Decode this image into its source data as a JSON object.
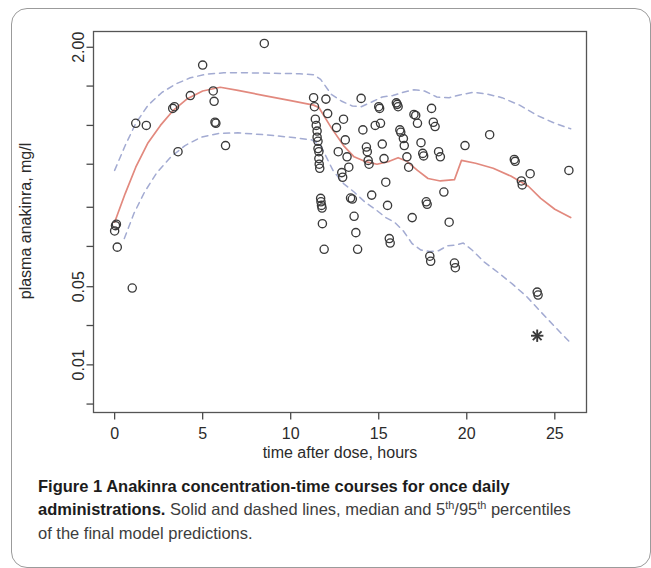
{
  "figure": {
    "caption_label": "Figure 1",
    "caption_title": " Anakinra concentration-time courses for once daily administrations.",
    "caption_rest_1": " Solid and dashed lines, median and 5",
    "caption_sup_1": "th",
    "caption_slash": "/95",
    "caption_sup_2": "th",
    "caption_rest_2": " percentiles of the final model predictions."
  },
  "colors": {
    "median_line": "#e2897e",
    "percentile_line": "#a3abd2",
    "point_stroke": "#3a3a3a",
    "axis": "#4a4a4a",
    "frame": "#555555"
  },
  "chart_data": {
    "type": "scatter",
    "title": "",
    "xlabel": "time after dose, hours",
    "ylabel": "plasma anakinra, mg/l",
    "yscale": "log",
    "xlim": [
      -1.2,
      26.8
    ],
    "ylim": [
      0.0072,
      2.55
    ],
    "grid": false,
    "legend": "none",
    "xticks": [
      0,
      5,
      10,
      15,
      20,
      25
    ],
    "xticklabels": [
      "0",
      "5",
      "10",
      "15",
      "20",
      "25"
    ],
    "yticks": [
      2.0,
      1.1,
      0.6,
      0.33,
      0.17,
      0.093,
      0.05,
      0.0275,
      0.015,
      0.0082
    ],
    "yticklabels": [
      "2.00",
      "",
      "",
      "",
      "",
      "",
      "0.05",
      "",
      "0.01",
      ""
    ],
    "ytick_labelled": [
      {
        "value": 2.0,
        "label": "2.00"
      },
      {
        "value": 0.05,
        "label": "0.05"
      },
      {
        "value": 0.01,
        "label": "0.01"
      }
    ],
    "series": [
      {
        "name": "observed concentrations",
        "marker": "open-circle",
        "points": [
          [
            0.0,
            0.118
          ],
          [
            0.05,
            0.128
          ],
          [
            0.1,
            0.131
          ],
          [
            0.15,
            0.092
          ],
          [
            1.0,
            0.049
          ],
          [
            1.2,
            0.62
          ],
          [
            1.8,
            0.6
          ],
          [
            3.3,
            0.78
          ],
          [
            3.4,
            0.8
          ],
          [
            3.6,
            0.4
          ],
          [
            4.3,
            0.95
          ],
          [
            5.0,
            1.52
          ],
          [
            5.6,
            1.02
          ],
          [
            5.65,
            0.87
          ],
          [
            5.7,
            0.63
          ],
          [
            5.75,
            0.62
          ],
          [
            6.3,
            0.44
          ],
          [
            8.5,
            2.12
          ],
          [
            11.3,
            0.92
          ],
          [
            11.35,
            0.8
          ],
          [
            11.4,
            0.66
          ],
          [
            11.45,
            0.6
          ],
          [
            11.5,
            0.55
          ],
          [
            11.5,
            0.5
          ],
          [
            11.55,
            0.47
          ],
          [
            11.55,
            0.42
          ],
          [
            11.6,
            0.4
          ],
          [
            11.6,
            0.36
          ],
          [
            11.62,
            0.33
          ],
          [
            11.65,
            0.31
          ],
          [
            11.7,
            0.195
          ],
          [
            11.72,
            0.185
          ],
          [
            11.75,
            0.175
          ],
          [
            11.78,
            0.168
          ],
          [
            11.8,
            0.132
          ],
          [
            11.9,
            0.089
          ],
          [
            12.0,
            0.9
          ],
          [
            12.1,
            0.72
          ],
          [
            12.6,
            0.58
          ],
          [
            12.7,
            0.4
          ],
          [
            12.9,
            0.29
          ],
          [
            12.95,
            0.27
          ],
          [
            13.0,
            0.66
          ],
          [
            13.1,
            0.48
          ],
          [
            13.2,
            0.37
          ],
          [
            13.3,
            0.315
          ],
          [
            13.4,
            0.196
          ],
          [
            13.5,
            0.193
          ],
          [
            13.6,
            0.148
          ],
          [
            13.7,
            0.115
          ],
          [
            13.8,
            0.089
          ],
          [
            14.0,
            0.91
          ],
          [
            14.1,
            0.56
          ],
          [
            14.3,
            0.43
          ],
          [
            14.35,
            0.4
          ],
          [
            14.4,
            0.35
          ],
          [
            14.45,
            0.33
          ],
          [
            14.6,
            0.205
          ],
          [
            14.8,
            0.6
          ],
          [
            15.0,
            0.8
          ],
          [
            15.05,
            0.78
          ],
          [
            15.1,
            0.62
          ],
          [
            15.2,
            0.45
          ],
          [
            15.3,
            0.36
          ],
          [
            15.4,
            0.25
          ],
          [
            15.5,
            0.175
          ],
          [
            15.6,
            0.105
          ],
          [
            15.65,
            0.098
          ],
          [
            16.0,
            0.85
          ],
          [
            16.05,
            0.83
          ],
          [
            16.1,
            0.8
          ],
          [
            16.2,
            0.56
          ],
          [
            16.25,
            0.54
          ],
          [
            16.4,
            0.49
          ],
          [
            16.45,
            0.44
          ],
          [
            16.6,
            0.37
          ],
          [
            16.7,
            0.315
          ],
          [
            16.9,
            0.145
          ],
          [
            17.0,
            0.71
          ],
          [
            17.1,
            0.7
          ],
          [
            17.2,
            0.62
          ],
          [
            17.4,
            0.46
          ],
          [
            17.5,
            0.39
          ],
          [
            17.55,
            0.375
          ],
          [
            17.7,
            0.185
          ],
          [
            17.75,
            0.178
          ],
          [
            17.9,
            0.08
          ],
          [
            17.95,
            0.074
          ],
          [
            18.0,
            0.78
          ],
          [
            18.1,
            0.63
          ],
          [
            18.2,
            0.59
          ],
          [
            18.4,
            0.4
          ],
          [
            18.5,
            0.37
          ],
          [
            18.7,
            0.215
          ],
          [
            19.0,
            0.135
          ],
          [
            19.3,
            0.072
          ],
          [
            19.35,
            0.067
          ],
          [
            19.9,
            0.44
          ],
          [
            21.3,
            0.52
          ],
          [
            22.7,
            0.355
          ],
          [
            22.75,
            0.345
          ],
          [
            23.1,
            0.255
          ],
          [
            23.15,
            0.24
          ],
          [
            23.6,
            0.285
          ],
          [
            24.0,
            0.046
          ],
          [
            24.05,
            0.044
          ],
          [
            25.8,
            0.3
          ]
        ]
      },
      {
        "name": "below quantification limit",
        "marker": "asterisk",
        "points": [
          [
            24.0,
            0.0235
          ]
        ]
      }
    ],
    "lines": [
      {
        "name": "median (50th percentile) model prediction",
        "style": "solid",
        "color": "#e2897e",
        "points": [
          [
            0.0,
            0.135
          ],
          [
            0.6,
            0.21
          ],
          [
            1.2,
            0.315
          ],
          [
            1.9,
            0.46
          ],
          [
            2.6,
            0.6
          ],
          [
            3.3,
            0.75
          ],
          [
            4.1,
            0.9
          ],
          [
            5.0,
            1.02
          ],
          [
            6.0,
            1.08
          ],
          [
            7.0,
            1.03
          ],
          [
            8.5,
            0.95
          ],
          [
            10.0,
            0.88
          ],
          [
            11.3,
            0.82
          ],
          [
            11.6,
            0.79
          ],
          [
            12.3,
            0.58
          ],
          [
            13.0,
            0.44
          ],
          [
            13.6,
            0.37
          ],
          [
            14.2,
            0.345
          ],
          [
            14.9,
            0.33
          ],
          [
            15.6,
            0.345
          ],
          [
            16.1,
            0.365
          ],
          [
            16.6,
            0.345
          ],
          [
            17.2,
            0.3
          ],
          [
            17.8,
            0.265
          ],
          [
            18.5,
            0.255
          ],
          [
            19.3,
            0.26
          ],
          [
            19.7,
            0.35
          ],
          [
            20.5,
            0.335
          ],
          [
            21.5,
            0.31
          ],
          [
            22.5,
            0.275
          ],
          [
            23.5,
            0.235
          ],
          [
            24.2,
            0.195
          ],
          [
            25.0,
            0.165
          ],
          [
            25.9,
            0.145
          ]
        ]
      },
      {
        "name": "95th percentile model prediction",
        "style": "dashed",
        "color": "#a3abd2",
        "points": [
          [
            0.0,
            0.3
          ],
          [
            0.6,
            0.44
          ],
          [
            1.2,
            0.62
          ],
          [
            1.9,
            0.82
          ],
          [
            2.7,
            1.0
          ],
          [
            3.5,
            1.14
          ],
          [
            4.3,
            1.25
          ],
          [
            5.2,
            1.32
          ],
          [
            6.2,
            1.35
          ],
          [
            7.5,
            1.35
          ],
          [
            9.0,
            1.34
          ],
          [
            10.5,
            1.33
          ],
          [
            11.3,
            1.31
          ],
          [
            11.7,
            1.22
          ],
          [
            12.3,
            0.97
          ],
          [
            12.9,
            0.87
          ],
          [
            13.5,
            0.81
          ],
          [
            14.0,
            0.8
          ],
          [
            14.6,
            0.86
          ],
          [
            15.2,
            0.93
          ],
          [
            15.8,
            0.95
          ],
          [
            16.4,
            1.0
          ],
          [
            17.0,
            1.04
          ],
          [
            17.6,
            1.02
          ],
          [
            18.3,
            0.93
          ],
          [
            19.0,
            0.92
          ],
          [
            19.6,
            0.96
          ],
          [
            20.4,
            1.0
          ],
          [
            21.2,
            0.97
          ],
          [
            22.0,
            0.92
          ],
          [
            23.0,
            0.82
          ],
          [
            24.0,
            0.7
          ],
          [
            25.0,
            0.62
          ],
          [
            25.9,
            0.57
          ]
        ]
      },
      {
        "name": "5th percentile model prediction",
        "style": "dashed",
        "color": "#a3abd2",
        "points": [
          [
            0.55,
            0.105
          ],
          [
            1.1,
            0.155
          ],
          [
            1.7,
            0.215
          ],
          [
            2.4,
            0.29
          ],
          [
            3.2,
            0.37
          ],
          [
            4.0,
            0.44
          ],
          [
            4.9,
            0.5
          ],
          [
            5.9,
            0.53
          ],
          [
            7.0,
            0.535
          ],
          [
            8.5,
            0.52
          ],
          [
            10.0,
            0.5
          ],
          [
            11.2,
            0.48
          ],
          [
            11.7,
            0.44
          ],
          [
            12.4,
            0.3
          ],
          [
            13.0,
            0.245
          ],
          [
            13.6,
            0.215
          ],
          [
            14.2,
            0.185
          ],
          [
            14.8,
            0.165
          ],
          [
            15.4,
            0.145
          ],
          [
            15.9,
            0.135
          ],
          [
            16.4,
            0.118
          ],
          [
            16.9,
            0.097
          ],
          [
            17.4,
            0.088
          ],
          [
            17.9,
            0.086
          ],
          [
            18.4,
            0.087
          ],
          [
            18.9,
            0.094
          ],
          [
            19.4,
            0.095
          ],
          [
            19.8,
            0.098
          ],
          [
            20.3,
            0.088
          ],
          [
            21.0,
            0.073
          ],
          [
            21.8,
            0.062
          ],
          [
            22.6,
            0.052
          ],
          [
            23.4,
            0.043
          ],
          [
            24.2,
            0.034
          ],
          [
            25.0,
            0.027
          ],
          [
            25.9,
            0.021
          ]
        ]
      }
    ]
  }
}
